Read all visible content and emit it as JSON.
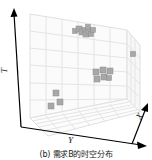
{
  "figure": {
    "caption": "(b) 需求B的时空分布",
    "background_color": "#ffffff"
  },
  "axes": {
    "vertical": {
      "label": "T",
      "name": "time-axis"
    },
    "depth_left": {
      "label": "Y",
      "name": "y-axis"
    },
    "depth_right": {
      "label": "X",
      "name": "x-axis"
    }
  },
  "chart_data": {
    "type": "scatter",
    "title": "(b) 需求B的时空分布",
    "xlabel": "X",
    "ylabel": "Y",
    "zlabel": "T",
    "grid": true,
    "legend": null,
    "marker": {
      "shape": "square",
      "color": "#a8a8a8",
      "edge_color": "#8c8c8c"
    },
    "panes": {
      "back_wall_color": "#fafafa",
      "side_wall_color": "#f7f7f7",
      "floor_color": "#fbfbfb",
      "grid_line_color": "#e2e2e2"
    },
    "axis_line_color": "#000000",
    "xlim": [
      0,
      6
    ],
    "ylim": [
      0,
      6
    ],
    "zlim": [
      0,
      6
    ],
    "points_px": [
      {
        "x": 75,
        "y": 31,
        "s": 5
      },
      {
        "x": 79,
        "y": 29,
        "s": 6
      },
      {
        "x": 82,
        "y": 32,
        "s": 6
      },
      {
        "x": 85,
        "y": 30,
        "s": 5
      },
      {
        "x": 86,
        "y": 34,
        "s": 6
      },
      {
        "x": 89,
        "y": 31,
        "s": 6
      },
      {
        "x": 91,
        "y": 34,
        "s": 5
      },
      {
        "x": 88,
        "y": 27,
        "s": 5
      },
      {
        "x": 93,
        "y": 30,
        "s": 5
      },
      {
        "x": 133,
        "y": 54,
        "s": 5
      },
      {
        "x": 96,
        "y": 72,
        "s": 6
      },
      {
        "x": 97,
        "y": 79,
        "s": 6
      },
      {
        "x": 103,
        "y": 70,
        "s": 6
      },
      {
        "x": 104,
        "y": 77,
        "s": 6
      },
      {
        "x": 110,
        "y": 71,
        "s": 6
      },
      {
        "x": 109,
        "y": 78,
        "s": 5
      },
      {
        "x": 56,
        "y": 93,
        "s": 6
      },
      {
        "x": 60,
        "y": 102,
        "s": 6
      },
      {
        "x": 51,
        "y": 106,
        "s": 6
      }
    ],
    "point_count": 19,
    "clusters": [
      {
        "name": "upper-back-cluster",
        "count": 9
      },
      {
        "name": "isolated-right-point",
        "count": 1
      },
      {
        "name": "mid-right-cluster",
        "count": 6
      },
      {
        "name": "lower-left-cluster",
        "count": 3
      }
    ]
  }
}
